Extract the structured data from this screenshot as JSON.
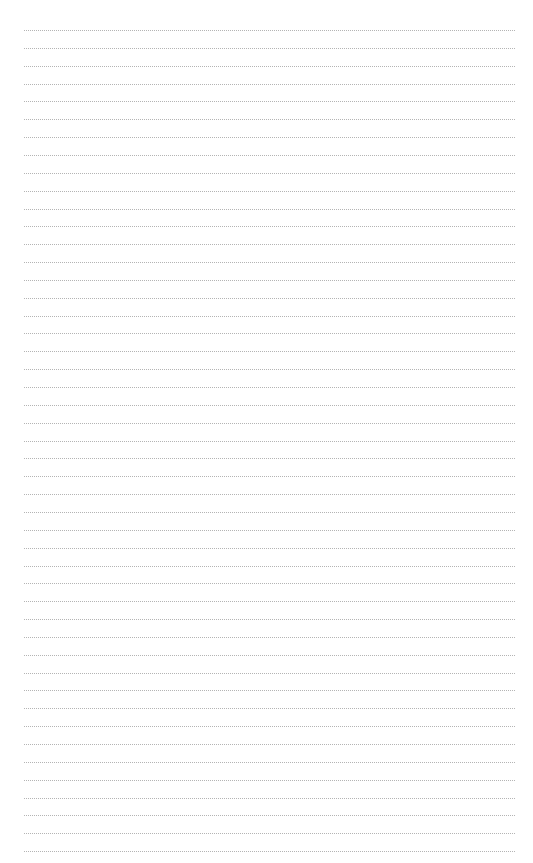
{
  "page": {
    "type": "lined-paper",
    "line_count": 47,
    "first_line_y": 30,
    "line_spacing": 17.85,
    "line_left": 24,
    "line_width": 491,
    "line_color": "#b4b4b4",
    "line_style": "dotted",
    "background": "#ffffff"
  }
}
